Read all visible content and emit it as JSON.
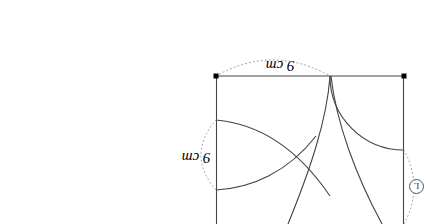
{
  "figure": {
    "orientation": "rotated-180",
    "background_color": "#ffffff",
    "stroke_color": "#444444",
    "dot_color": "#000000",
    "dotted_color": "#888888",
    "dimensions": {
      "top": {
        "value": "9",
        "unit": "cm",
        "text": "9 cm"
      },
      "left": {
        "value": "9",
        "unit": "cm",
        "text": "9 cm"
      }
    },
    "badges": {
      "right": {
        "text": "L"
      }
    },
    "square": {
      "left": 216,
      "top": 76,
      "right": 404,
      "width_px": 188
    },
    "markers": [
      {
        "name": "top-left-vertex",
        "x": 216,
        "y": 76
      },
      {
        "name": "top-right-vertex",
        "x": 404,
        "y": 76
      }
    ]
  }
}
